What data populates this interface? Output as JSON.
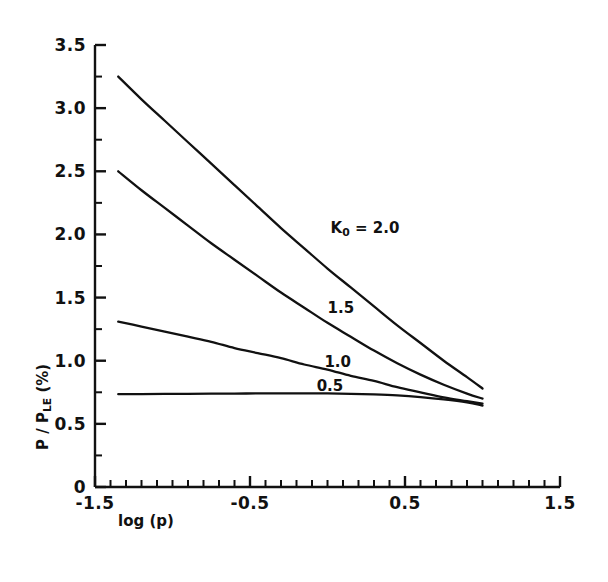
{
  "chart_data": {
    "type": "line",
    "title": "",
    "xlabel": "log (p)",
    "ylabel": "P / P_LE (%)",
    "ylabel_parts": {
      "numerator": "P",
      "separator": "/",
      "denominator": "P",
      "denominator_sub": "LE",
      "unit": "(%)"
    },
    "xlim": [
      -1.5,
      1.5
    ],
    "ylim": [
      0,
      3.5
    ],
    "xticks": [
      -1.5,
      -0.5,
      0.5,
      1.5
    ],
    "xticklabels": [
      "-1.5",
      "-0.5",
      "0.5",
      "1.5"
    ],
    "xminor_step": 0.1,
    "yticks": [
      0,
      0.5,
      1.0,
      1.5,
      2.0,
      2.5,
      3.0,
      3.5
    ],
    "yticklabels": [
      "0",
      "0.5",
      "1.0",
      "1.5",
      "2.0",
      "2.5",
      "3.0",
      "3.5"
    ],
    "yminor_step": 0.25,
    "grid": false,
    "legend": "inline-labels",
    "line_color": "#111111",
    "series": [
      {
        "name": "K0 = 2.0",
        "label": "2.0",
        "label_prefix": "K",
        "label_sub": "0",
        "label_eq": "=",
        "label_x": 0.02,
        "label_y": 2.05,
        "x": [
          -1.35,
          -1.2,
          -1.05,
          -0.9,
          -0.75,
          -0.6,
          -0.45,
          -0.3,
          -0.15,
          0.0,
          0.15,
          0.3,
          0.45,
          0.6,
          0.75,
          0.9,
          1.0
        ],
        "y": [
          3.25,
          3.07,
          2.9,
          2.73,
          2.56,
          2.39,
          2.22,
          2.05,
          1.89,
          1.73,
          1.58,
          1.43,
          1.28,
          1.14,
          1.0,
          0.87,
          0.78
        ]
      },
      {
        "name": "K0 = 1.5",
        "label": "1.5",
        "label_x": 0.0,
        "label_y": 1.42,
        "x": [
          -1.35,
          -1.2,
          -1.05,
          -0.9,
          -0.75,
          -0.6,
          -0.45,
          -0.3,
          -0.15,
          0.0,
          0.15,
          0.3,
          0.45,
          0.6,
          0.75,
          0.9,
          1.0
        ],
        "y": [
          2.5,
          2.35,
          2.21,
          2.07,
          1.93,
          1.8,
          1.67,
          1.54,
          1.42,
          1.3,
          1.19,
          1.08,
          0.98,
          0.89,
          0.81,
          0.74,
          0.7
        ]
      },
      {
        "name": "K0 = 1.0",
        "label": "1.0",
        "label_x": -0.02,
        "label_y": 0.99,
        "x": [
          -1.35,
          -1.2,
          -1.05,
          -0.9,
          -0.75,
          -0.6,
          -0.45,
          -0.3,
          -0.15,
          0.0,
          0.15,
          0.3,
          0.45,
          0.6,
          0.75,
          0.9,
          1.0
        ],
        "y": [
          1.31,
          1.27,
          1.23,
          1.19,
          1.15,
          1.1,
          1.06,
          1.02,
          0.97,
          0.93,
          0.88,
          0.84,
          0.79,
          0.75,
          0.71,
          0.68,
          0.66
        ]
      },
      {
        "name": "K0 = 0.5",
        "label": "0.5",
        "label_x": -0.07,
        "label_y": 0.8,
        "x": [
          -1.35,
          -1.2,
          -1.05,
          -0.9,
          -0.75,
          -0.6,
          -0.45,
          -0.3,
          -0.15,
          0.0,
          0.15,
          0.3,
          0.45,
          0.6,
          0.75,
          0.9,
          1.0
        ],
        "y": [
          0.735,
          0.736,
          0.737,
          0.738,
          0.739,
          0.74,
          0.741,
          0.742,
          0.742,
          0.741,
          0.738,
          0.733,
          0.725,
          0.712,
          0.694,
          0.67,
          0.645
        ]
      }
    ]
  }
}
